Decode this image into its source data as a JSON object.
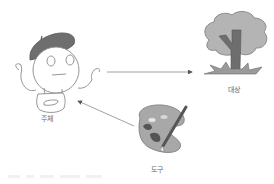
{
  "diagram": {
    "nodes": [
      {
        "id": "subject",
        "label": "주체",
        "icon": "artist-with-beret-icon"
      },
      {
        "id": "object",
        "label": "대상",
        "icon": "tree-icon"
      },
      {
        "id": "tool",
        "label": "도구",
        "icon": "palette-and-brush-icon"
      }
    ],
    "edges": [
      {
        "from": "subject",
        "to": "object"
      },
      {
        "from": "tool",
        "to": "subject"
      }
    ]
  },
  "labels": {
    "subject": "주체",
    "object": "대상",
    "tool": "도구"
  },
  "colors": {
    "line": "#8a8a8a",
    "fill_dark": "#6e6e6e",
    "fill_light": "#b4b4b4",
    "outline": "#7a7a7a"
  }
}
